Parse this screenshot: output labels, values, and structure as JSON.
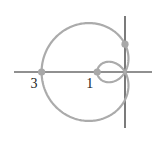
{
  "figure": {
    "type": "polar-curve",
    "equation": "r = 1 - 2cos(theta)",
    "curve_name": "limacon with inner loop",
    "colors": {
      "background": "#ffffff",
      "axes": "#222222",
      "curve": "#ababab",
      "points": "#a8a8a8"
    },
    "pixel_mapping": {
      "origin_x": 125,
      "origin_y": 72,
      "px_per_unit": 27.8
    },
    "axes": {
      "x_range_px": [
        14,
        152
      ],
      "y_range_px": [
        16,
        128
      ]
    },
    "labels": [
      {
        "text": "3",
        "x": -3,
        "y": 0
      },
      {
        "text": "1",
        "x": -1,
        "y": 0
      }
    ],
    "marked_points": [
      {
        "name": "point-neg-3",
        "x": -3,
        "y": 0
      },
      {
        "name": "point-neg-1",
        "x": -1,
        "y": 0
      },
      {
        "name": "point-y-1",
        "x": 0,
        "y": 1
      }
    ],
    "curve_params": {
      "a": 1,
      "b": -2,
      "theta_start": 0,
      "theta_end": 6.2832,
      "steps": 360
    }
  },
  "chart_data": {
    "type": "line",
    "title": "",
    "xlabel": "",
    "ylabel": "",
    "polar_equation": "r = 1 - 2cos(theta)",
    "key_points": [
      {
        "theta": "0",
        "r": -1,
        "x": -1,
        "y": 0
      },
      {
        "theta": "pi/2",
        "r": 1,
        "x": 0,
        "y": 1
      },
      {
        "theta": "pi",
        "r": 3,
        "x": -3,
        "y": 0
      },
      {
        "theta": "3pi/2",
        "r": 1,
        "x": 0,
        "y": -1
      }
    ],
    "tick_labels": [
      "3",
      "1"
    ],
    "xlim": [
      -4,
      1
    ],
    "ylim": [
      -2,
      2
    ],
    "grid": false
  }
}
